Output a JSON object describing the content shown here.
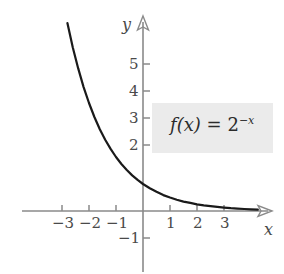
{
  "chart_data": {
    "type": "line",
    "title": "",
    "xlabel": "x",
    "ylabel": "y",
    "xlim": [
      -3.6,
      4.8
    ],
    "ylim": [
      -1.7,
      6.6
    ],
    "grid": false,
    "legend": null,
    "annotation": "f(x) = 2^{-x}",
    "xticks": [
      -3,
      -2,
      -1,
      1,
      2,
      3
    ],
    "xtick_labels": [
      "−3",
      "−2",
      "−1",
      "1",
      "2",
      "3"
    ],
    "yticks": [
      -1,
      2,
      3,
      4,
      5
    ],
    "ytick_labels": [
      "−1",
      "2",
      "3",
      "4",
      "5"
    ],
    "series": [
      {
        "name": "f(x) = 2^{-x}",
        "color": "#1a1a1a",
        "x": [
          -2.8,
          -2.6,
          -2.4,
          -2.2,
          -2.0,
          -1.8,
          -1.6,
          -1.4,
          -1.2,
          -1.0,
          -0.8,
          -0.6,
          -0.4,
          -0.2,
          0.0,
          0.25,
          0.5,
          0.75,
          1.0,
          1.25,
          1.5,
          1.75,
          2.0,
          2.25,
          2.5,
          2.75,
          3.0,
          3.25,
          3.5,
          3.75,
          4.0,
          4.25
        ],
        "y": [
          6.96,
          6.06,
          5.28,
          4.59,
          4.0,
          3.48,
          3.03,
          2.64,
          2.3,
          2.0,
          1.74,
          1.52,
          1.32,
          1.15,
          1.0,
          0.84,
          0.71,
          0.59,
          0.5,
          0.42,
          0.35,
          0.3,
          0.25,
          0.21,
          0.18,
          0.15,
          0.125,
          0.105,
          0.088,
          0.074,
          0.0625,
          0.053
        ]
      }
    ]
  },
  "axes": {
    "x_label": "x",
    "y_label": "y",
    "axis_color": "#8a8a8a"
  },
  "annotation": {
    "fn_name": "f",
    "fn_arg": "(x)",
    "equals": "=",
    "base": "2",
    "exponent": "−x",
    "background_color": "#ebebeb"
  },
  "tick_labels": {
    "x_neg_3": "−3",
    "x_neg_2": "−2",
    "x_neg_1": "−1",
    "x_pos_1": "1",
    "x_pos_2": "2",
    "x_pos_3": "3",
    "y_5": "5",
    "y_4": "4",
    "y_3": "3",
    "y_2": "2",
    "y_neg_1": "−1"
  }
}
